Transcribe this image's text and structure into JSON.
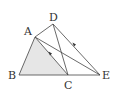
{
  "diagram": {
    "type": "geometry",
    "shaded_triangle": "ABC",
    "colors": {
      "stroke": "#444444",
      "fill": "#e6e6e6",
      "label": "#333333"
    },
    "points": {
      "A": {
        "label": "A",
        "x": 35,
        "y": 37
      },
      "D": {
        "label": "D",
        "x": 53,
        "y": 24
      },
      "B": {
        "label": "B",
        "x": 19,
        "y": 75
      },
      "C": {
        "label": "C",
        "x": 68,
        "y": 75
      },
      "E": {
        "label": "E",
        "x": 100,
        "y": 75
      }
    },
    "segments": [
      "AB",
      "BE",
      "AC",
      "AE",
      "AD",
      "DC",
      "DE"
    ],
    "parallel_marks": [
      "AC",
      "DE"
    ]
  }
}
